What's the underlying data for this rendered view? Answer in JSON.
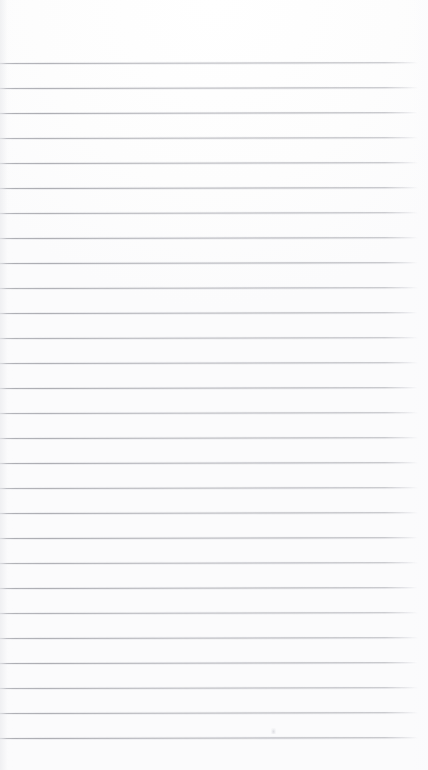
{
  "page": {
    "kind": "scanned-lined-notepad-page",
    "width_px": 428,
    "height_px": 770,
    "background_color": "#fefefe",
    "paper_tone": "#fdfdfd",
    "orientation": "portrait",
    "content_text": "",
    "has_handwriting": false,
    "has_printed_text": false
  },
  "ruling": {
    "line_count": 28,
    "first_line_y": 63,
    "line_spacing_px": 25,
    "last_line_y": 738,
    "line_thickness_px": 1,
    "line_color": "#a5a6ac",
    "line_start_x": 0,
    "line_end_x": 418,
    "style": "wide-ruled-horizontal",
    "has_vertical_margin_rule": false
  },
  "margins": {
    "top_margin_px": 63,
    "bottom_margin_px": 32,
    "left_margin_px": 0,
    "right_margin_px": 10
  },
  "artifacts": {
    "scan_speck": {
      "x": 271,
      "y": 728,
      "description": "faint scanner speck above lower rule line"
    },
    "edge_shading": "slight gray falloff along left edge"
  },
  "lines": [
    {
      "index": 1,
      "y": 63
    },
    {
      "index": 2,
      "y": 88
    },
    {
      "index": 3,
      "y": 113
    },
    {
      "index": 4,
      "y": 138
    },
    {
      "index": 5,
      "y": 163
    },
    {
      "index": 6,
      "y": 188
    },
    {
      "index": 7,
      "y": 213
    },
    {
      "index": 8,
      "y": 238
    },
    {
      "index": 9,
      "y": 263
    },
    {
      "index": 10,
      "y": 288
    },
    {
      "index": 11,
      "y": 313
    },
    {
      "index": 12,
      "y": 338
    },
    {
      "index": 13,
      "y": 363
    },
    {
      "index": 14,
      "y": 388
    },
    {
      "index": 15,
      "y": 413
    },
    {
      "index": 16,
      "y": 438
    },
    {
      "index": 17,
      "y": 463
    },
    {
      "index": 18,
      "y": 488
    },
    {
      "index": 19,
      "y": 513
    },
    {
      "index": 20,
      "y": 538
    },
    {
      "index": 21,
      "y": 563
    },
    {
      "index": 22,
      "y": 588
    },
    {
      "index": 23,
      "y": 613
    },
    {
      "index": 24,
      "y": 638
    },
    {
      "index": 25,
      "y": 663
    },
    {
      "index": 26,
      "y": 688
    },
    {
      "index": 27,
      "y": 713
    },
    {
      "index": 28,
      "y": 738
    }
  ]
}
